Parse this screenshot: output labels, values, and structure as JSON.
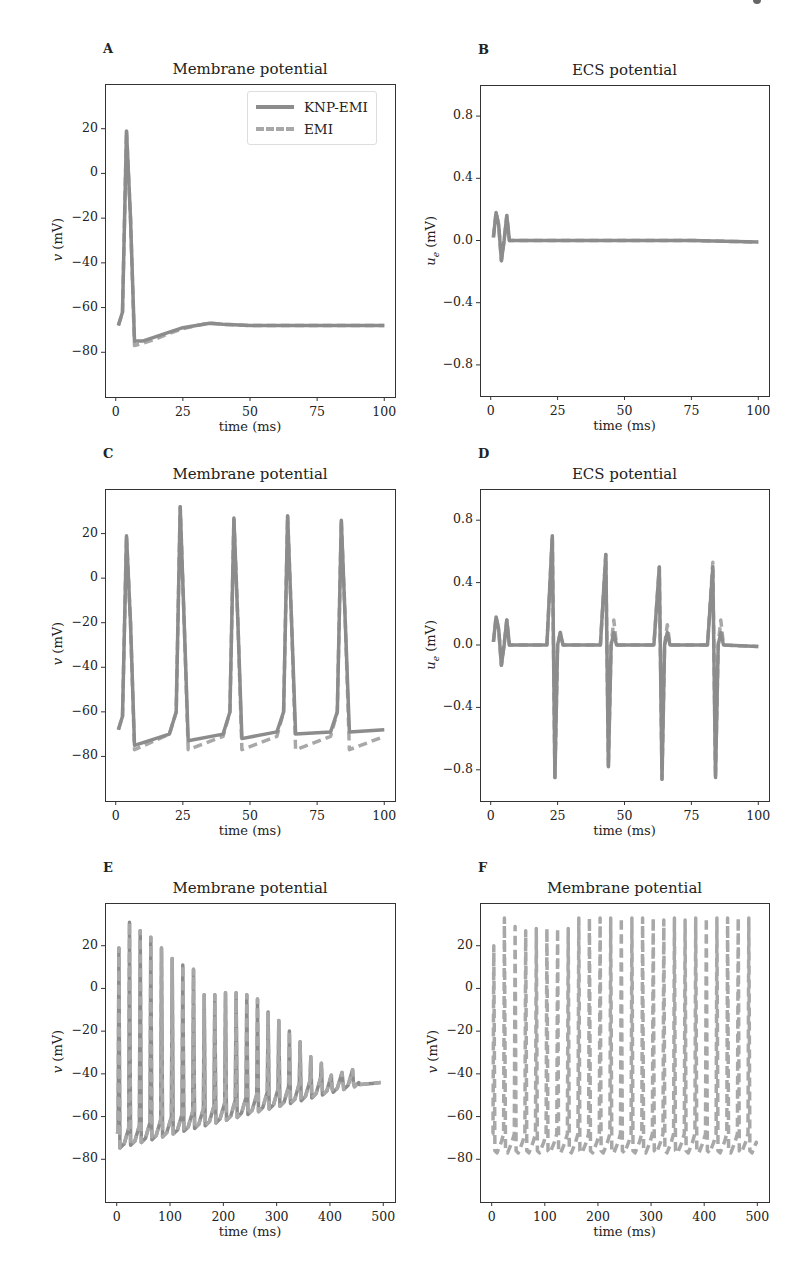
{
  "figure": {
    "panels": [
      {
        "id": "A",
        "title": "Membrane potential",
        "ylabel": "v (mV)",
        "xlabel": "time (ms)"
      },
      {
        "id": "B",
        "title": "ECS potential",
        "ylabel": "u_e (mV)",
        "xlabel": "time (ms)"
      },
      {
        "id": "C",
        "title": "Membrane potential",
        "ylabel": "v (mV)",
        "xlabel": "time (ms)"
      },
      {
        "id": "D",
        "title": "ECS potential",
        "ylabel": "u_e (mV)",
        "xlabel": "time (ms)"
      },
      {
        "id": "E",
        "title": "Membrane potential",
        "ylabel": "v (mV)",
        "xlabel": "time (ms)"
      },
      {
        "id": "F",
        "title": "Membrane potential",
        "ylabel": "v (mV)",
        "xlabel": "time (ms)"
      }
    ],
    "legend": {
      "items": [
        {
          "label": "KNP-EMI",
          "style": "solid"
        },
        {
          "label": "EMI",
          "style": "dashed"
        }
      ]
    },
    "ticks": {
      "v_y": [
        "20",
        "0",
        "−20",
        "−40",
        "−60",
        "−80"
      ],
      "ue_y": [
        "0.8",
        "0.4",
        "0.0",
        "−0.4",
        "−0.8"
      ],
      "x100": [
        "0",
        "25",
        "50",
        "75",
        "100"
      ],
      "x500": [
        "0",
        "100",
        "200",
        "300",
        "400",
        "500"
      ]
    },
    "colors": {
      "knp_emi": "#8c8c8c",
      "emi": "#a8a8a8",
      "axis": "#333333"
    }
  },
  "chart_data": [
    {
      "panel": "A",
      "type": "line",
      "title": "Membrane potential",
      "xlabel": "time (ms)",
      "ylabel": "v (mV)",
      "xlim": [
        -4,
        104
      ],
      "ylim": [
        -100,
        40
      ],
      "xticks": [
        0,
        25,
        50,
        75,
        100
      ],
      "yticks": [
        20,
        0,
        -20,
        -40,
        -60,
        -80
      ],
      "legend": [
        "KNP-EMI",
        "EMI"
      ],
      "legend_position": "upper right",
      "series": [
        {
          "name": "KNP-EMI",
          "style": "solid",
          "x": [
            1,
            2.5,
            4,
            5.5,
            7,
            10,
            15,
            20,
            25,
            30,
            35,
            40,
            50,
            60,
            75,
            100
          ],
          "y": [
            -68,
            -62,
            19,
            -20,
            -75,
            -75,
            -73,
            -71,
            -69,
            -68,
            -67,
            -67.5,
            -68,
            -68,
            -68,
            -68
          ]
        },
        {
          "name": "EMI",
          "style": "dashed",
          "x": [
            1,
            2.5,
            4,
            5.5,
            7,
            10,
            15,
            20,
            25,
            30,
            35,
            40,
            50,
            60,
            75,
            100
          ],
          "y": [
            -68,
            -62,
            19,
            -20,
            -77,
            -76,
            -74,
            -71.5,
            -69.5,
            -68,
            -67,
            -67.5,
            -68,
            -68,
            -68,
            -68
          ]
        }
      ]
    },
    {
      "panel": "B",
      "type": "line",
      "title": "ECS potential",
      "xlabel": "time (ms)",
      "ylabel": "u_e (mV)",
      "xlim": [
        -4,
        104
      ],
      "ylim": [
        -1.0,
        1.0
      ],
      "xticks": [
        0,
        25,
        50,
        75,
        100
      ],
      "yticks": [
        0.8,
        0.4,
        0.0,
        -0.4,
        -0.8
      ],
      "series": [
        {
          "name": "KNP-EMI",
          "style": "solid",
          "x": [
            1,
            2,
            3,
            4,
            5,
            6,
            7,
            10,
            25,
            50,
            75,
            100
          ],
          "y": [
            0.02,
            0.18,
            0.1,
            -0.13,
            0.0,
            0.16,
            0.0,
            0.0,
            0.0,
            0.0,
            0.0,
            -0.01
          ]
        },
        {
          "name": "EMI",
          "style": "dashed",
          "x": [
            1,
            2,
            3,
            4,
            5,
            6,
            7,
            10,
            25,
            50,
            75,
            100
          ],
          "y": [
            0.02,
            0.18,
            0.1,
            -0.13,
            0.0,
            0.16,
            0.0,
            0.0,
            0.0,
            0.0,
            0.0,
            -0.01
          ]
        }
      ]
    },
    {
      "panel": "C",
      "type": "line",
      "title": "Membrane potential",
      "xlabel": "time (ms)",
      "ylabel": "v (mV)",
      "xlim": [
        -4,
        104
      ],
      "ylim": [
        -100,
        40
      ],
      "xticks": [
        0,
        25,
        50,
        75,
        100
      ],
      "yticks": [
        20,
        0,
        -20,
        -40,
        -60,
        -80
      ],
      "spike_times_ms": [
        4,
        24,
        44,
        64,
        84
      ],
      "spike_peaks_mV": [
        19,
        32,
        27,
        28,
        26
      ],
      "series": [
        {
          "name": "KNP-EMI",
          "style": "solid",
          "x": [
            1,
            2.5,
            4,
            5.5,
            7,
            20,
            22.5,
            24,
            25.5,
            27,
            40,
            42.5,
            44,
            45.5,
            47,
            60,
            62.5,
            64,
            65.5,
            67,
            80,
            82.5,
            84,
            85.5,
            87,
            100
          ],
          "y": [
            -68,
            -62,
            19,
            -20,
            -75,
            -70,
            -60,
            32,
            -20,
            -73,
            -70,
            -60,
            27,
            -20,
            -72,
            -69,
            -60,
            28,
            -20,
            -70,
            -69,
            -60,
            26,
            -20,
            -69,
            -68
          ]
        },
        {
          "name": "EMI",
          "style": "dashed",
          "x": [
            1,
            2.5,
            4,
            5.5,
            7,
            20,
            22.5,
            24,
            25.5,
            27,
            40,
            42.5,
            44,
            45.5,
            47,
            60,
            62.5,
            64,
            65.5,
            67,
            80,
            82.5,
            84,
            85.5,
            87,
            100
          ],
          "y": [
            -68,
            -62,
            19,
            -20,
            -77,
            -70,
            -60,
            32,
            -20,
            -77,
            -71,
            -60,
            27,
            -20,
            -77,
            -71,
            -60,
            28,
            -20,
            -77,
            -71,
            -60,
            26,
            -20,
            -77,
            -71
          ]
        }
      ]
    },
    {
      "panel": "D",
      "type": "line",
      "title": "ECS potential",
      "xlabel": "time (ms)",
      "ylabel": "u_e (mV)",
      "xlim": [
        -4,
        104
      ],
      "ylim": [
        -1.0,
        1.0
      ],
      "xticks": [
        0,
        25,
        50,
        75,
        100
      ],
      "yticks": [
        0.8,
        0.4,
        0.0,
        -0.4,
        -0.8
      ],
      "spike_times_ms": [
        4,
        24,
        44,
        64,
        84
      ],
      "positive_peaks": [
        0.18,
        0.7,
        0.58,
        0.5,
        0.53
      ],
      "negative_peaks": [
        -0.13,
        -0.85,
        -0.78,
        -0.86,
        -0.85
      ],
      "series": [
        {
          "name": "KNP-EMI",
          "style": "solid",
          "x": [
            1,
            2,
            3,
            4,
            5,
            6,
            7,
            21,
            23,
            24,
            25,
            26,
            27,
            41,
            43,
            44,
            45,
            46,
            47,
            61,
            63,
            64,
            65,
            66,
            67,
            81,
            83,
            84,
            85,
            86,
            87,
            100
          ],
          "y": [
            0.02,
            0.18,
            0.1,
            -0.13,
            0.0,
            0.16,
            0.0,
            0.0,
            0.7,
            -0.85,
            0.0,
            0.08,
            0.0,
            0.0,
            0.58,
            -0.78,
            0.0,
            0.08,
            0.0,
            0.0,
            0.5,
            -0.86,
            0.0,
            0.08,
            0.0,
            0.0,
            0.5,
            -0.85,
            0.0,
            0.08,
            0.0,
            -0.01
          ]
        },
        {
          "name": "EMI",
          "style": "dashed",
          "x": [
            1,
            2,
            3,
            4,
            5,
            6,
            7,
            21,
            23,
            24,
            25,
            26,
            27,
            41,
            43,
            44,
            45,
            46,
            47,
            61,
            63,
            64,
            65,
            66,
            67,
            81,
            83,
            84,
            85,
            86,
            87,
            100
          ],
          "y": [
            0.02,
            0.18,
            0.1,
            -0.13,
            0.0,
            0.16,
            0.0,
            0.0,
            0.7,
            -0.85,
            0.0,
            0.08,
            0.0,
            0.0,
            0.58,
            -0.78,
            0.0,
            0.16,
            0.0,
            0.0,
            0.5,
            -0.86,
            0.0,
            0.13,
            0.0,
            0.0,
            0.53,
            -0.85,
            0.0,
            0.16,
            0.0,
            -0.01
          ]
        }
      ]
    },
    {
      "panel": "E",
      "type": "line",
      "title": "Membrane potential",
      "xlabel": "time (ms)",
      "ylabel": "v (mV)",
      "xlim": [
        -22,
        522
      ],
      "ylim": [
        -100,
        40
      ],
      "xticks": [
        0,
        100,
        200,
        300,
        400,
        500
      ],
      "yticks": [
        20,
        0,
        -20,
        -40,
        -60,
        -80
      ],
      "spike_times_ms": [
        4,
        24,
        44,
        64,
        84,
        104,
        124,
        144,
        164,
        184,
        204,
        224,
        244,
        264,
        284,
        304,
        324,
        344,
        364,
        384,
        404,
        424,
        444
      ],
      "spike_peaks_mV": [
        19,
        31,
        27,
        24,
        19,
        14,
        11,
        9,
        -3,
        -3,
        -2,
        -2,
        -3,
        -5,
        -11,
        -15,
        -20,
        -25,
        -32,
        -35,
        -47,
        -43,
        -44
      ],
      "trough_mV_start": -75,
      "trough_mV_end": -45,
      "final_value_mV": -44,
      "series": [
        {
          "name": "KNP-EMI",
          "style": "solid"
        },
        {
          "name": "EMI",
          "style": "dashed"
        }
      ]
    },
    {
      "panel": "F",
      "type": "line",
      "title": "Membrane potential",
      "xlabel": "time (ms)",
      "ylabel": "v (mV)",
      "xlim": [
        -22,
        522
      ],
      "ylim": [
        -100,
        40
      ],
      "xticks": [
        0,
        100,
        200,
        300,
        400,
        500
      ],
      "yticks": [
        20,
        0,
        -20,
        -40,
        -60,
        -80
      ],
      "spike_times_ms": [
        4,
        24,
        44,
        64,
        84,
        104,
        124,
        144,
        164,
        184,
        204,
        224,
        244,
        264,
        284,
        304,
        324,
        344,
        364,
        384,
        404,
        424,
        444,
        464,
        484
      ],
      "spike_peaks_mV": [
        20,
        33,
        29,
        27,
        28,
        28,
        28,
        28,
        33,
        33,
        33,
        33,
        33,
        33,
        33,
        33,
        32,
        33,
        32,
        33,
        33,
        33,
        33,
        33,
        33
      ],
      "trough_mV": -76,
      "series": [
        {
          "name": "KNP-EMI",
          "style": "solid"
        },
        {
          "name": "EMI",
          "style": "dashed"
        }
      ]
    }
  ]
}
